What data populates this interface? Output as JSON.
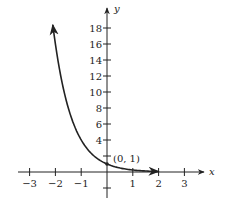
{
  "chart_data": {
    "type": "line",
    "title": "",
    "xlabel": "x",
    "ylabel": "y",
    "function": "y = (1/4)^x",
    "x_ticks": [
      -3,
      -2,
      -1,
      1,
      2,
      3
    ],
    "x_tick_labels": [
      "−3",
      "−2",
      "−1",
      "1",
      "2",
      "3"
    ],
    "y_ticks": [
      2,
      4,
      6,
      8,
      10,
      12,
      14,
      16,
      18
    ],
    "y_tick_labels": [
      "",
      "4",
      "6",
      "8",
      "10",
      "12",
      "14",
      "16",
      "18"
    ],
    "xlim": [
      -3.5,
      4
    ],
    "ylim": [
      -3,
      20
    ],
    "grid": false,
    "series": [
      {
        "name": "exponential decay curve",
        "x": [
          -2.1,
          -2,
          -1.5,
          -1,
          -0.5,
          0,
          0.5,
          1,
          1.5,
          2
        ],
        "y": [
          18.4,
          16,
          8,
          4,
          2,
          1,
          0.5,
          0.25,
          0.125,
          0.0625
        ]
      }
    ],
    "annotations": [
      {
        "text": "(0, 1)",
        "x": 0,
        "y": 1
      }
    ]
  }
}
